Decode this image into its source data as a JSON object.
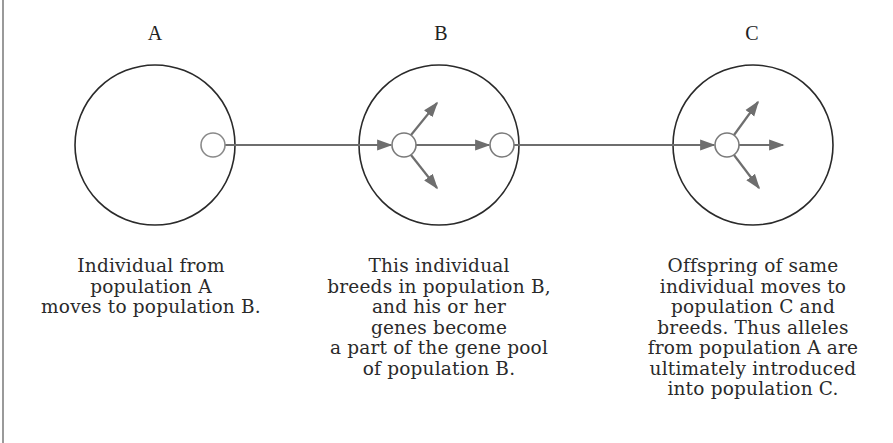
{
  "populations": [
    {
      "label": "A",
      "caption_lines": [
        "Individual from",
        "population A",
        "moves to population B."
      ]
    },
    {
      "label": "B",
      "caption_lines": [
        "This individual",
        "breeds in population B,",
        "and his or her",
        "genes become",
        "a part of the gene pool",
        "of population B."
      ]
    },
    {
      "label": "C",
      "caption_lines": [
        "Offspring of same",
        "individual moves to",
        "population C and",
        "breeds. Thus alleles",
        "from population A are",
        "ultimately introduced",
        "into population C."
      ]
    }
  ],
  "colors": {
    "circle_stroke": "#2a2a2a",
    "arrow": "#6e6e6e",
    "individual_stroke": "#7a7a7a"
  }
}
